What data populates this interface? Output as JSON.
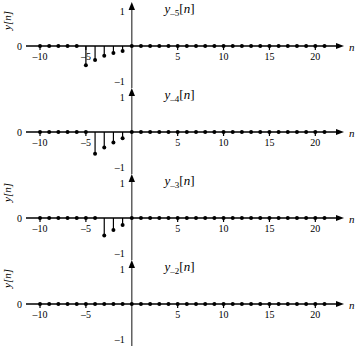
{
  "figure": {
    "width": 359,
    "height": 355,
    "background": "#ffffff",
    "foreground": "#000000"
  },
  "axis_common": {
    "xlabel": "n",
    "ylabel": "y[n]",
    "xticks": [
      -10,
      -5,
      5,
      10,
      15,
      20
    ],
    "xtick_labels": [
      "–10",
      "–5",
      "5",
      "10",
      "15",
      "20"
    ],
    "yticks": [
      -1,
      0,
      1
    ],
    "ytick_labels": [
      "–1",
      "0",
      "1"
    ],
    "xlim": [
      -11.2,
      21.6
    ],
    "ylim": [
      -1.45,
      1.35
    ],
    "grid": false,
    "legend": "none"
  },
  "panels": [
    {
      "title_base": "y",
      "title_sub": "–5",
      "title_arg": "[n]",
      "title_plain": "y₋₅[n]",
      "chart_index": 0
    },
    {
      "title_base": "y",
      "title_sub": "–4",
      "title_arg": "[n]",
      "title_plain": "y₋₄[n]",
      "chart_index": 1
    },
    {
      "title_base": "y",
      "title_sub": "–3",
      "title_arg": "[n]",
      "title_plain": "y₋₃[n]",
      "chart_index": 2
    },
    {
      "title_base": "y",
      "title_sub": "–2",
      "title_arg": "[n]",
      "title_plain": "y₋₂[n]",
      "chart_index": 3
    }
  ],
  "chart_data": [
    {
      "type": "scatter",
      "stem": true,
      "title": "y–5[n]",
      "xlabel": "n",
      "ylabel": "y[n]",
      "xlim": [
        -11.2,
        21.6
      ],
      "ylim": [
        -1.45,
        1.35
      ],
      "xticks": [
        -10,
        -5,
        5,
        10,
        15,
        20
      ],
      "yticks": [
        -1,
        0,
        1
      ],
      "grid": false,
      "x": [
        -10,
        -9,
        -8,
        -7,
        -6,
        -5,
        -4,
        -3,
        -2,
        -1,
        0,
        1,
        2,
        3,
        4,
        5,
        6,
        7,
        8,
        9,
        10,
        11,
        12,
        13,
        14,
        15,
        16,
        17,
        18,
        19,
        20,
        21
      ],
      "values": [
        0,
        0,
        0,
        0,
        0,
        -0.55,
        -0.4,
        -0.28,
        -0.2,
        -0.14,
        0,
        0,
        0,
        0,
        0,
        0,
        0,
        0,
        0,
        0,
        0,
        0,
        0,
        0,
        0,
        0,
        0,
        0,
        0,
        0,
        0,
        0
      ]
    },
    {
      "type": "scatter",
      "stem": true,
      "title": "y–4[n]",
      "xlabel": "n",
      "ylabel": "y[n]",
      "xlim": [
        -11.2,
        21.6
      ],
      "ylim": [
        -1.45,
        1.35
      ],
      "xticks": [
        -10,
        -5,
        5,
        10,
        15,
        20
      ],
      "yticks": [
        -1,
        0,
        1
      ],
      "grid": false,
      "x": [
        -10,
        -9,
        -8,
        -7,
        -6,
        -5,
        -4,
        -3,
        -2,
        -1,
        0,
        1,
        2,
        3,
        4,
        5,
        6,
        7,
        8,
        9,
        10,
        11,
        12,
        13,
        14,
        15,
        16,
        17,
        18,
        19,
        20,
        21
      ],
      "values": [
        0,
        0,
        0,
        0,
        0,
        0,
        -0.62,
        -0.44,
        -0.3,
        -0.18,
        0,
        0,
        0,
        0,
        0,
        0,
        0,
        0,
        0,
        0,
        0,
        0,
        0,
        0,
        0,
        0,
        0,
        0,
        0,
        0,
        0,
        0
      ]
    },
    {
      "type": "scatter",
      "stem": true,
      "title": "y–3[n]",
      "xlabel": "n",
      "ylabel": "y[n]",
      "xlim": [
        -11.2,
        21.6
      ],
      "ylim": [
        -1.45,
        1.35
      ],
      "xticks": [
        -10,
        -5,
        5,
        10,
        15,
        20
      ],
      "yticks": [
        -1,
        0,
        1
      ],
      "grid": false,
      "x": [
        -10,
        -9,
        -8,
        -7,
        -6,
        -5,
        -4,
        -3,
        -2,
        -1,
        0,
        1,
        2,
        3,
        4,
        5,
        6,
        7,
        8,
        9,
        10,
        11,
        12,
        13,
        14,
        15,
        16,
        17,
        18,
        19,
        20,
        21
      ],
      "values": [
        0,
        0,
        0,
        0,
        0,
        0,
        0,
        -0.5,
        -0.34,
        -0.2,
        0,
        0,
        0,
        0,
        0,
        0,
        0,
        0,
        0,
        0,
        0,
        0,
        0,
        0,
        0,
        0,
        0,
        0,
        0,
        0,
        0,
        0
      ]
    },
    {
      "type": "scatter",
      "stem": true,
      "title": "y–2[n]",
      "xlabel": "n",
      "ylabel": "y[n]",
      "xlim": [
        -11.2,
        21.6
      ],
      "ylim": [
        -1.45,
        1.35
      ],
      "xticks": [
        -10,
        -5,
        5,
        10,
        15,
        20
      ],
      "yticks": [
        -1,
        0,
        1
      ],
      "grid": false,
      "x": [
        -10,
        -9,
        -8,
        -7,
        -6,
        -5,
        -4,
        -3,
        -2,
        -1,
        0,
        1,
        2,
        3,
        4,
        5,
        6,
        7,
        8,
        9,
        10,
        11,
        12,
        13,
        14,
        15,
        16,
        17,
        18,
        19,
        20,
        21
      ],
      "values": [
        0,
        0,
        0,
        0,
        0,
        0,
        0,
        0,
        0,
        0,
        0,
        0,
        0,
        0,
        0,
        0,
        0,
        0,
        0,
        0,
        0,
        0,
        0,
        0,
        0,
        0,
        0,
        0,
        0,
        0,
        0,
        0
      ]
    }
  ]
}
